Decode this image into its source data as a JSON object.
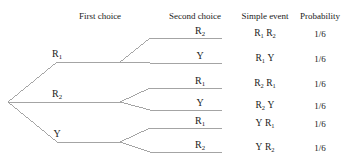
{
  "figure": {
    "type": "probability-tree-diagram",
    "line_color": "#9a9a9a",
    "text_color": "#1a1a1a",
    "background": "#ffffff"
  },
  "headers": [
    {
      "label": "First choice",
      "x": 100
    },
    {
      "label": "Second choice",
      "x": 195
    },
    {
      "label": "Simple event",
      "x": 265
    },
    {
      "label": "Probability",
      "x": 320
    }
  ],
  "first_choice_nodes": [
    {
      "base": "R",
      "sub": "1",
      "x": 57,
      "y": 62
    },
    {
      "base": "R",
      "sub": "2",
      "x": 57,
      "y": 102
    },
    {
      "base": "Y",
      "sub": "",
      "x": 57,
      "y": 142
    }
  ],
  "second_choice_leaves": [
    {
      "base": "R",
      "sub": "2",
      "x": 200,
      "y": 38
    },
    {
      "base": "Y",
      "sub": "",
      "x": 200,
      "y": 63
    },
    {
      "base": "R",
      "sub": "1",
      "x": 200,
      "y": 88
    },
    {
      "base": "Y",
      "sub": "",
      "x": 200,
      "y": 110
    },
    {
      "base": "R",
      "sub": "1",
      "x": 200,
      "y": 128
    },
    {
      "base": "R",
      "sub": "2",
      "x": 200,
      "y": 152
    }
  ],
  "simple_events": [
    {
      "first_base": "R",
      "first_sub": "1",
      "second_base": "R",
      "second_sub": "2",
      "x": 265,
      "y": 38
    },
    {
      "first_base": "R",
      "first_sub": "1",
      "second_base": "Y",
      "second_sub": "",
      "x": 265,
      "y": 63
    },
    {
      "first_base": "R",
      "first_sub": "2",
      "second_base": "R",
      "second_sub": "1",
      "x": 265,
      "y": 88
    },
    {
      "first_base": "R",
      "first_sub": "2",
      "second_base": "Y",
      "second_sub": "",
      "x": 265,
      "y": 110
    },
    {
      "first_base": "Y",
      "first_sub": "",
      "second_base": "R",
      "second_sub": "1",
      "x": 265,
      "y": 128
    },
    {
      "first_base": "Y",
      "first_sub": "",
      "second_base": "R",
      "second_sub": "2",
      "x": 265,
      "y": 152
    }
  ],
  "probabilities": [
    {
      "value": "1/6",
      "x": 320,
      "y": 38
    },
    {
      "value": "1/6",
      "x": 320,
      "y": 63
    },
    {
      "value": "1/6",
      "x": 320,
      "y": 88
    },
    {
      "value": "1/6",
      "x": 320,
      "y": 110
    },
    {
      "value": "1/6",
      "x": 320,
      "y": 128
    },
    {
      "value": "1/6",
      "x": 320,
      "y": 152
    }
  ],
  "geometry": {
    "root": {
      "x": 8,
      "y": 102
    },
    "level1_x": 57,
    "level1_run_end_x": 120,
    "leaf_run_end_x": 222,
    "leaf_slope_end_x": 150,
    "level1_ys": [
      62,
      102,
      142
    ],
    "leaf_ys": [
      38,
      63,
      88,
      110,
      128,
      152
    ]
  }
}
